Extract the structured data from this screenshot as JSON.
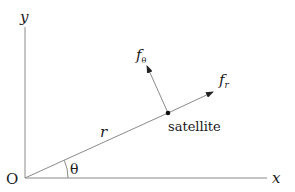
{
  "diagram": {
    "axes": {
      "x_label": "x",
      "y_label": "y",
      "origin_label": "O"
    },
    "radius_label": "r",
    "angle_label": "θ",
    "satellite_label": "satellite",
    "force_radial": {
      "base": "f",
      "sub": "r"
    },
    "force_tangential": {
      "base": "f",
      "sub": "θ"
    },
    "colors": {
      "line": "#8a8a8a",
      "arrow": "#222222",
      "text": "#1a1a1a",
      "background": "#ffffff"
    }
  }
}
